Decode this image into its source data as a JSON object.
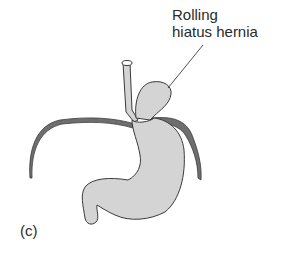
{
  "diagram": {
    "label_line1": "Rolling",
    "label_line2": "hiatus hernia",
    "panel_label": "(c)",
    "colors": {
      "stomach_fill": "#d4d4d4",
      "outline": "#3a3a3a",
      "diaphragm": "#6e6e6e",
      "text": "#2a2a2a"
    }
  }
}
